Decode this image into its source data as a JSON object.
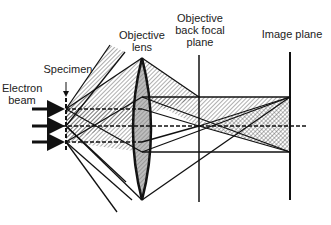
{
  "diagram": {
    "labels": {
      "electron_beam": "Electron\nbeam",
      "specimen": "Specimen",
      "objective_lens": "Objective\nlens",
      "back_focal_plane": "Objective\nback focal\nplane",
      "image_plane": "Image plane"
    },
    "colors": {
      "line": "#111111",
      "hatch": "#444444",
      "lens_fill": "#bdbdbd",
      "background": "#ffffff"
    }
  }
}
